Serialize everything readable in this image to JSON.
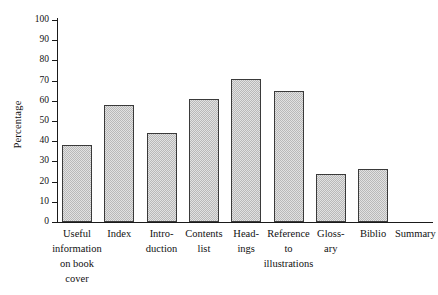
{
  "chart_data": {
    "type": "bar",
    "title": "",
    "subtitle": "",
    "xlabel": "",
    "ylabel": "Percentage",
    "ylim": [
      0,
      100
    ],
    "grid": false,
    "legend": "none",
    "y_ticks": [
      100,
      90,
      80,
      70,
      60,
      50,
      40,
      30,
      20,
      10,
      0
    ],
    "y_tick_labels": [
      "100",
      "90",
      "80",
      "70",
      "60",
      "50",
      "40",
      "30",
      "20",
      "10",
      "0"
    ],
    "categories": [
      "Useful\ninformation\non book\ncover",
      "Index",
      "Intro-\nduction",
      "Contents\nlist",
      "Head-\nings",
      "Reference\nto\nillustrations",
      "Gloss-\nary",
      "Biblio",
      "Summary"
    ],
    "values": [
      38,
      58,
      44,
      61,
      71,
      65,
      24,
      26,
      0
    ],
    "bar_fill": "#cfcfcf",
    "bar_edge": "#3a3a3a",
    "axis_color": "#1a1a1a",
    "background": "#ffffff"
  }
}
